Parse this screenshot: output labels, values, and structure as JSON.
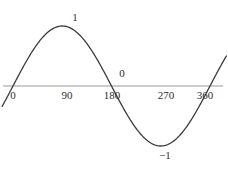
{
  "figure": {
    "name": "sine-curve-graph",
    "width": 228,
    "height": 174,
    "background_color": "#ffffff",
    "axis_color": "#9a9a9a",
    "curve_color": "#3b3b3b",
    "text_color": "#2e2e2e"
  },
  "chart_data": {
    "type": "line",
    "title": "",
    "xlabel": "",
    "ylabel": "",
    "xlim": [
      -20,
      400
    ],
    "ylim": [
      -1.35,
      1.35
    ],
    "grid": false,
    "legend": null,
    "series": [
      {
        "name": "sin(x)",
        "x": [
          -20,
          0,
          15,
          30,
          45,
          60,
          75,
          90,
          105,
          120,
          135,
          150,
          165,
          180,
          195,
          210,
          225,
          240,
          255,
          270,
          285,
          300,
          315,
          330,
          345,
          360,
          375,
          390
        ],
        "values": [
          -0.342,
          0.0,
          0.259,
          0.5,
          0.707,
          0.866,
          0.966,
          1.0,
          0.966,
          0.866,
          0.707,
          0.5,
          0.259,
          0.0,
          -0.259,
          -0.5,
          -0.707,
          -0.866,
          -0.966,
          -1.0,
          -0.966,
          -0.866,
          -0.707,
          -0.5,
          -0.259,
          0.0,
          0.259,
          0.5
        ]
      }
    ],
    "x_ticks": [
      {
        "value": 0,
        "label": "0"
      },
      {
        "value": 90,
        "label": "90"
      },
      {
        "value": 180,
        "label": "180"
      },
      {
        "value": 270,
        "label": "270"
      },
      {
        "value": 360,
        "label": "360"
      }
    ],
    "annotations": [
      {
        "name": "max-value-label",
        "text": "1",
        "x": 90,
        "y": 1.0,
        "position": "above"
      },
      {
        "name": "zero-value-label",
        "text": "0",
        "x": 196,
        "y": 0.0,
        "position": "above-right"
      },
      {
        "name": "min-value-label",
        "text": "−1",
        "x": 270,
        "y": -1.0,
        "position": "below"
      }
    ]
  },
  "axis": {
    "name": "x-axis",
    "orientation": "horizontal",
    "start_x": 0,
    "end_x": 400
  }
}
